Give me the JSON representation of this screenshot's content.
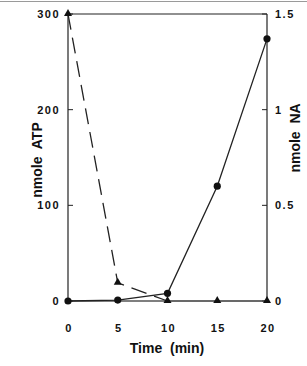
{
  "chart_data": {
    "type": "line",
    "title": "",
    "xlabel": "Time  (min)",
    "ylabel_left": "nmole  ATP",
    "ylabel_right": "nmole  NA",
    "x": [
      0,
      5,
      10,
      15,
      20
    ],
    "xlim": [
      0,
      20
    ],
    "ylim_left": [
      0,
      300
    ],
    "ylim_right": [
      0,
      1.5
    ],
    "x_ticks": [
      "0",
      "5",
      "10",
      "15",
      "20"
    ],
    "y_ticks_left": [
      "0",
      "100",
      "200",
      "300"
    ],
    "y_ticks_right": [
      "0",
      "0.5",
      "1",
      "1.5"
    ],
    "grid": false,
    "legend": null,
    "series": [
      {
        "name": "ATP",
        "axis": "left",
        "marker": "triangle",
        "line_style": "dashed",
        "values": [
          300,
          19,
          0,
          0,
          0
        ],
        "segments_dashed_until_x": 10
      },
      {
        "name": "NA",
        "axis": "right",
        "marker": "circle",
        "line_style": "solid",
        "values": [
          0,
          0.005,
          0.04,
          0.6,
          1.37
        ]
      }
    ]
  }
}
